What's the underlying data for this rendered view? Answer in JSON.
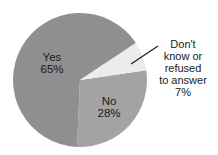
{
  "chart_data": {
    "type": "pie",
    "title": "",
    "categories": [
      "Yes",
      "No",
      "Don't know or refused to answer"
    ],
    "values": [
      65,
      28,
      7
    ],
    "unit": "%",
    "colors": [
      "#8f8f8f",
      "#a3a3a3",
      "#ececec"
    ],
    "labels": {
      "yes": {
        "name": "Yes",
        "value": "65%"
      },
      "no": {
        "name": "No",
        "value": "28%"
      },
      "dont_know": {
        "lines": [
          "Don't",
          "know or",
          "refused",
          "to answer"
        ],
        "value": "7%"
      }
    },
    "legend": "none (direct labels)"
  }
}
